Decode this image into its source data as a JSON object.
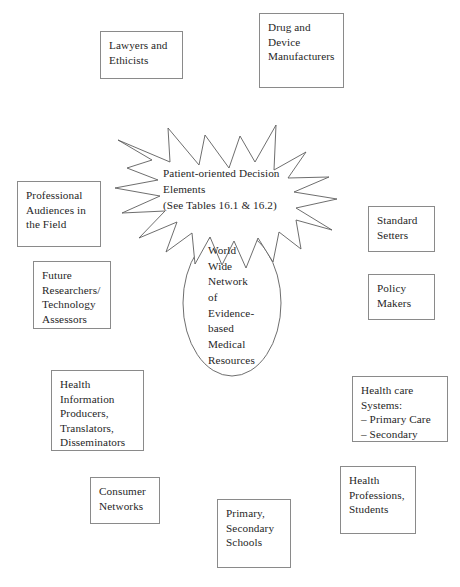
{
  "diagram": {
    "center": {
      "starburst": {
        "label": "Patient-oriented Decision\nElements\n(See Tables 16.1 & 16.2)",
        "shape": "starburst"
      },
      "oval": {
        "label": "World\nWide\nNetwork\nof\nEvidence-\nbased\nMedical\nResources",
        "shape": "ellipse"
      }
    },
    "nodes": [
      {
        "id": "lawyers-and-ethicists",
        "label": "Lawyers and\nEthicists",
        "x": 100,
        "y": 31,
        "w": 83,
        "h": 48
      },
      {
        "id": "drug-and-device-manufacturers",
        "label": "Drug and\nDevice\nManufacturers",
        "x": 259,
        "y": 13,
        "w": 85,
        "h": 75
      },
      {
        "id": "professional-audiences-in-the-field",
        "label": "Professional\nAudiences in\nthe Field",
        "x": 17,
        "y": 181,
        "w": 84,
        "h": 66
      },
      {
        "id": "standard-setters",
        "label": "Standard\nSetters",
        "x": 368,
        "y": 206,
        "w": 67,
        "h": 46
      },
      {
        "id": "future-researchers-technology-assessors",
        "label": "Future\nResearchers/\nTechnology\nAssessors",
        "x": 33,
        "y": 261,
        "w": 78,
        "h": 68
      },
      {
        "id": "policy-makers",
        "label": "Policy\nMakers",
        "x": 368,
        "y": 274,
        "w": 67,
        "h": 46
      },
      {
        "id": "health-information-producers",
        "label": "Health\nInformation\nProducers,\nTranslators,\nDisseminators",
        "x": 51,
        "y": 370,
        "w": 93,
        "h": 81
      },
      {
        "id": "health-care-systems",
        "label": "Health care\nSystems:\n– Primary Care\n– Secondary",
        "x": 352,
        "y": 376,
        "w": 96,
        "h": 66
      },
      {
        "id": "consumer-networks",
        "label": "Consumer\nNetworks",
        "x": 90,
        "y": 477,
        "w": 70,
        "h": 47
      },
      {
        "id": "health-professions-students",
        "label": "Health\nProfessions,\nStudents",
        "x": 340,
        "y": 466,
        "w": 76,
        "h": 68
      },
      {
        "id": "primary-secondary-schools",
        "label": "Primary,\nSecondary\nSchools",
        "x": 217,
        "y": 499,
        "w": 74,
        "h": 69
      }
    ]
  }
}
